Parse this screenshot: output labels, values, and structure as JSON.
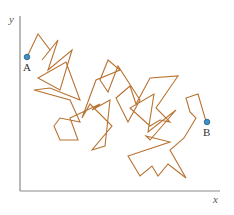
{
  "figure": {
    "axes": {
      "x_label": "x",
      "y_label": "y",
      "color": "#8a8a8a"
    },
    "path_color": "#b87333",
    "point_color": "#3d8fc4",
    "points": {
      "start": {
        "label": "A",
        "x": 27,
        "y": 57
      },
      "end": {
        "label": "B",
        "x": 207,
        "y": 122
      }
    },
    "path_points": [
      [
        27,
        57
      ],
      [
        38,
        34
      ],
      [
        50,
        50
      ],
      [
        42,
        60
      ],
      [
        58,
        40
      ],
      [
        48,
        70
      ],
      [
        72,
        50
      ],
      [
        60,
        90
      ],
      [
        38,
        78
      ],
      [
        66,
        62
      ],
      [
        80,
        100
      ],
      [
        50,
        88
      ],
      [
        34,
        90
      ],
      [
        70,
        100
      ],
      [
        80,
        122
      ],
      [
        60,
        118
      ],
      [
        54,
        126
      ],
      [
        60,
        140
      ],
      [
        78,
        140
      ],
      [
        70,
        118
      ],
      [
        100,
        104
      ],
      [
        92,
        110
      ],
      [
        110,
        100
      ],
      [
        105,
        146
      ],
      [
        92,
        150
      ],
      [
        112,
        126
      ],
      [
        90,
        104
      ],
      [
        82,
        118
      ],
      [
        96,
        80
      ],
      [
        120,
        70
      ],
      [
        108,
        60
      ],
      [
        100,
        80
      ],
      [
        108,
        92
      ],
      [
        118,
        66
      ],
      [
        140,
        100
      ],
      [
        128,
        122
      ],
      [
        116,
        98
      ],
      [
        130,
        86
      ],
      [
        136,
        104
      ],
      [
        150,
        78
      ],
      [
        178,
        76
      ],
      [
        156,
        108
      ],
      [
        170,
        122
      ],
      [
        160,
        120
      ],
      [
        150,
        126
      ],
      [
        130,
        108
      ],
      [
        154,
        94
      ],
      [
        148,
        132
      ],
      [
        176,
        110
      ],
      [
        150,
        140
      ],
      [
        146,
        136
      ],
      [
        170,
        142
      ],
      [
        128,
        156
      ],
      [
        140,
        176
      ],
      [
        152,
        166
      ],
      [
        158,
        176
      ],
      [
        168,
        164
      ],
      [
        186,
        178
      ],
      [
        170,
        150
      ],
      [
        184,
        138
      ],
      [
        196,
        118
      ],
      [
        190,
        112
      ],
      [
        186,
        98
      ],
      [
        198,
        94
      ],
      [
        205,
        118
      ],
      [
        207,
        122
      ]
    ]
  }
}
